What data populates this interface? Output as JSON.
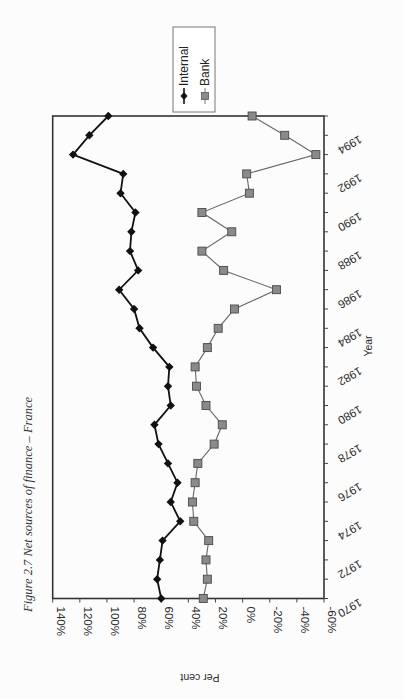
{
  "figure": {
    "caption": "Figure 2.7 Net sources of finance – France",
    "page_number": "49"
  },
  "chart_data": {
    "type": "line",
    "title": "Figure 2.7 Net sources of finance – France",
    "xlabel": "Year",
    "ylabel": "Per cent",
    "orientation_note": "page rotated 90 degrees clockwise",
    "x": [
      1970,
      1971,
      1972,
      1973,
      1974,
      1975,
      1976,
      1977,
      1978,
      1979,
      1980,
      1981,
      1982,
      1983,
      1984,
      1985,
      1986,
      1987,
      1988,
      1989,
      1990,
      1991,
      1992,
      1993,
      1994,
      1995
    ],
    "x_tick_labels": [
      "1970",
      "1972",
      "1974",
      "1976",
      "1978",
      "1980",
      "1982",
      "1984",
      "1986",
      "1988",
      "1990",
      "1992",
      "1994"
    ],
    "y_tick_labels": [
      "140%",
      "120%",
      "100%",
      "80%",
      "60%",
      "40%",
      "20%",
      "0%",
      "-20%",
      "-40%",
      "-60%"
    ],
    "ylim": [
      -60,
      140
    ],
    "xlim": [
      1970,
      1995
    ],
    "grid": false,
    "legend_position": "top-right (rotated frame)",
    "series": [
      {
        "name": "Internal",
        "marker": "diamond",
        "color": "#111111",
        "values": [
          60,
          63,
          61,
          59,
          46,
          53,
          48,
          55,
          62,
          65,
          53,
          55,
          54,
          66,
          76,
          80,
          91,
          77,
          83,
          82,
          79,
          90,
          88,
          125,
          113,
          99
        ]
      },
      {
        "name": "Bank",
        "marker": "square",
        "color": "#666666",
        "values": [
          29,
          26,
          27,
          25,
          36,
          37,
          35,
          33,
          21,
          15,
          27,
          34,
          35,
          26,
          18,
          6,
          -25,
          14,
          30,
          8,
          30,
          -5,
          -3,
          -54,
          -31,
          -7
        ]
      }
    ]
  },
  "layout": {
    "plot_left": 52.7,
    "plot_right": 324,
    "plot_top": 116,
    "plot_bottom": 598.5,
    "y_min": -60,
    "y_max": 140,
    "x_min": 1970,
    "x_max": 1995
  }
}
